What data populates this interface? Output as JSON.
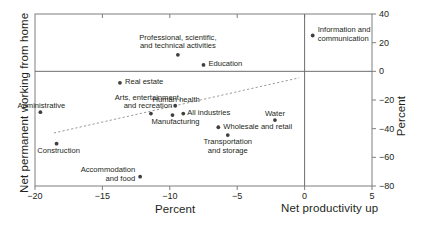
{
  "chart_data": {
    "type": "scatter",
    "title": "",
    "xlabel": "Percent",
    "ylabel_left": "Net permanent working from home",
    "ylabel_right": "Percent",
    "annotation": "Net productivity up",
    "xlim": [
      -20,
      5
    ],
    "ylim": [
      -80,
      40
    ],
    "xticks": [
      -20,
      -15,
      -10,
      -5,
      0,
      5
    ],
    "xtick_labels": [
      "−20",
      "−15",
      "−10",
      "−5",
      "0",
      "5"
    ],
    "yticks": [
      40,
      20,
      0,
      -20,
      -40,
      -60,
      -80
    ],
    "ytick_labels": [
      "40",
      "20",
      "0",
      "−20",
      "−40",
      "−60",
      "−80"
    ],
    "grid": false,
    "zero_lines": {
      "x": 0,
      "y": 0
    },
    "trend_line": {
      "x0": -18.6,
      "y0": -43.0,
      "x1": -0.4,
      "y1": -4.5
    },
    "marker_color": "#3f3f3f",
    "axis_color": "#7f7f7f",
    "points": [
      {
        "label": "Information and\ncommunication",
        "x": 0.6,
        "y": 25.0,
        "label_pos": "right",
        "label_dx": 5,
        "label_dy": -9
      },
      {
        "label": "Professional, scientific,\nand technical activities",
        "x": -9.4,
        "y": 11.5,
        "label_pos": "center",
        "label_dx": 0,
        "label_dy": -21
      },
      {
        "label": "Education",
        "x": -7.5,
        "y": 4.5,
        "label_pos": "right",
        "label_dx": 5,
        "label_dy": -4
      },
      {
        "label": "Real estate",
        "x": -13.7,
        "y": -8.0,
        "label_pos": "right",
        "label_dx": 5,
        "label_dy": -4
      },
      {
        "label": "Human health",
        "x": -9.6,
        "y": -24.0,
        "label_pos": "center",
        "label_dx": 1,
        "label_dy": -10
      },
      {
        "label": "All industries",
        "x": -9.0,
        "y": -29.5,
        "label_pos": "right",
        "label_dx": 4,
        "label_dy": -4
      },
      {
        "label": "Manufacturing",
        "x": -9.8,
        "y": -30.5,
        "label_pos": "center",
        "label_dx": 3,
        "label_dy": 3
      },
      {
        "label": "Arts, entertainment,\nand recreation",
        "x": -11.4,
        "y": -29.5,
        "label_pos": "center",
        "label_dx": -3,
        "label_dy": -20
      },
      {
        "label": "Administrative",
        "x": -19.6,
        "y": -28.5,
        "label_pos": "center",
        "label_dx": 1,
        "label_dy": -10
      },
      {
        "label": "Water",
        "x": -2.2,
        "y": -34.0,
        "label_pos": "center",
        "label_dx": 0,
        "label_dy": -10
      },
      {
        "label": "Wholesale and retail",
        "x": -6.4,
        "y": -39.0,
        "label_pos": "right",
        "label_dx": 5,
        "label_dy": -4
      },
      {
        "label": "Transportation\nand storage",
        "x": -5.7,
        "y": -44.5,
        "label_pos": "center",
        "label_dx": 0,
        "label_dy": 3
      },
      {
        "label": "Construction",
        "x": -18.4,
        "y": -50.5,
        "label_pos": "center",
        "label_dx": 2,
        "label_dy": 3
      },
      {
        "label": "Accommodation\nand food",
        "x": -12.2,
        "y": -73.5,
        "label_pos": "left",
        "label_dx": -5,
        "label_dy": -10
      }
    ]
  }
}
